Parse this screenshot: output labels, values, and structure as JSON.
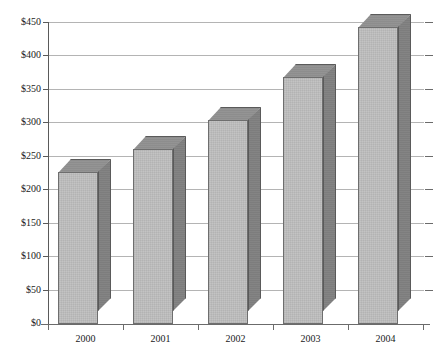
{
  "chart_data": {
    "type": "bar",
    "title": "",
    "subtitle": "",
    "xlabel": "",
    "ylabel": "",
    "categories": [
      "2000",
      "2001",
      "2002",
      "2003",
      "2004"
    ],
    "values": [
      226,
      261,
      304,
      368,
      443
    ],
    "series": [
      {
        "name": "",
        "values": [
          226,
          261,
          304,
          368,
          443
        ]
      }
    ],
    "ylim": [
      0,
      450
    ],
    "ytick_values": [
      0,
      50,
      100,
      150,
      200,
      250,
      300,
      350,
      400,
      450
    ],
    "ytick_labels": [
      "$0",
      "$50",
      "$100",
      "$150",
      "$200",
      "$250",
      "$300",
      "$350",
      "$400",
      "$450"
    ],
    "grid": true,
    "grid_axis": "y",
    "legend": false,
    "legend_position": "none",
    "annotations": [],
    "style": "3d-column",
    "colors": {
      "bar_front": "#c3c3c3",
      "bar_side": "#7d7d7d",
      "bar_top": "#8d8d8d",
      "bar_outline": "#6e6e6e",
      "gridline": "#b4b4b4",
      "axis": "#5a5a5a",
      "background": "#ffffff",
      "text": "#1a1a1a"
    }
  }
}
